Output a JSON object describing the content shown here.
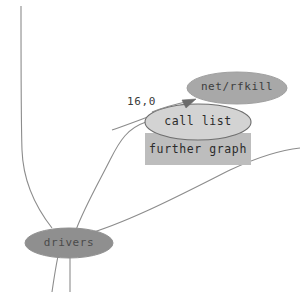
{
  "diagram": {
    "background_color": "#ffffff",
    "edge_color": "#8c8c8c",
    "nodes": [
      {
        "id": "net-rfkill",
        "label": "net/rfkill",
        "shape": "ellipse",
        "fill": "#a8a8a8",
        "cx": 237,
        "cy": 88,
        "rx": 50,
        "ry": 16
      },
      {
        "id": "call-list",
        "label": "call list",
        "shape": "ellipse",
        "fill": "#d3d3d3",
        "cx": 198,
        "cy": 122,
        "rx": 53,
        "ry": 18
      },
      {
        "id": "further-graph",
        "label": "further graph",
        "shape": "rect",
        "fill": "#bdbdbd",
        "x": 145,
        "y": 133,
        "width": 106,
        "height": 32
      },
      {
        "id": "drivers",
        "label": "drivers",
        "shape": "ellipse",
        "fill": "#8f8f8f",
        "cx": 69,
        "cy": 243,
        "rx": 44,
        "ry": 15
      }
    ],
    "edges": [
      {
        "id": "edge-weight-label",
        "label": "16,0",
        "from": "drivers",
        "to": "net-rfkill",
        "arrow": true
      }
    ]
  },
  "labels": {
    "net_rfkill": "net/rfkill",
    "call_list": "call list",
    "further_graph": "further graph",
    "drivers": "drivers",
    "edge_weight": "16,0"
  }
}
